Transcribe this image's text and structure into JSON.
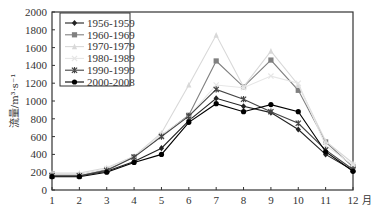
{
  "chart_data": {
    "type": "line",
    "title": "",
    "xlabel": "月",
    "ylabel": "流量/m³·s⁻¹",
    "x": [
      1,
      2,
      3,
      4,
      5,
      6,
      7,
      8,
      9,
      10,
      11,
      12
    ],
    "xlim": [
      1,
      12
    ],
    "ylim": [
      0,
      2000
    ],
    "yticks": [
      0,
      200,
      400,
      600,
      800,
      1000,
      1200,
      1400,
      1600,
      1800,
      2000
    ],
    "grid": false,
    "legend_position": "upper-left (boxed)",
    "series": [
      {
        "name": "1956-1959",
        "marker": "diamond",
        "color": "#222222",
        "values": [
          160,
          160,
          210,
          320,
          470,
          780,
          1030,
          940,
          870,
          680,
          400,
          220
        ]
      },
      {
        "name": "1960-1969",
        "marker": "square",
        "color": "#808080",
        "values": [
          170,
          170,
          230,
          370,
          610,
          840,
          1450,
          1160,
          1460,
          1120,
          540,
          260
        ]
      },
      {
        "name": "1970-1979",
        "marker": "triangle",
        "color": "#d8d8d8",
        "values": [
          190,
          190,
          250,
          380,
          640,
          1180,
          1740,
          1160,
          1560,
          1180,
          550,
          300
        ]
      },
      {
        "name": "1980-1989",
        "marker": "x",
        "color": "#e6e6e6",
        "values": [
          170,
          170,
          240,
          370,
          620,
          830,
          1180,
          1150,
          1280,
          1200,
          500,
          280
        ]
      },
      {
        "name": "1990-1999",
        "marker": "asterisk",
        "color": "#444444",
        "values": [
          160,
          160,
          220,
          370,
          600,
          830,
          1130,
          1020,
          880,
          750,
          450,
          230
        ]
      },
      {
        "name": "2000-2008",
        "marker": "circle",
        "color": "#000000",
        "values": [
          150,
          150,
          200,
          310,
          400,
          760,
          970,
          880,
          960,
          880,
          430,
          210
        ]
      }
    ]
  }
}
